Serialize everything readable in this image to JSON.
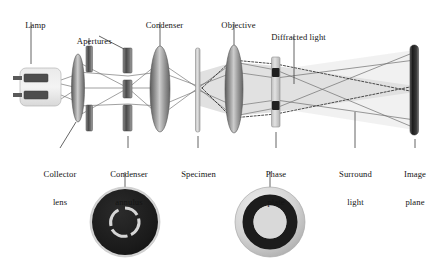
{
  "figure": {
    "colors": {
      "background": "#ffffff",
      "ink": "#141414",
      "lens_dark": "#5d5d5d",
      "lens_mid": "#8e8e8e",
      "lens_light": "#c8c8c8",
      "glass_light": "#d9d9d9",
      "ray_line": "#6b6b6b",
      "beam_fill": "#d7d7d7",
      "disc_dark": "#1f1f1f",
      "disc_light": "#cfcfcf"
    }
  },
  "labels_top": [
    {
      "key": "lamp",
      "text": "Lamp",
      "x": 8,
      "y": 12
    },
    {
      "key": "apertures",
      "text": "Apertures",
      "x": 64,
      "y": 29
    },
    {
      "key": "condenser",
      "text": "Condenser",
      "x": 133,
      "y": 12
    },
    {
      "key": "objective",
      "text": "Objective",
      "x": 210,
      "y": 12
    },
    {
      "key": "diffracted_light",
      "text": "Diffracted light",
      "x": 256,
      "y": 24
    }
  ],
  "labels_bottom": [
    {
      "key": "collector_lens",
      "line1": "Collector",
      "line2": "lens",
      "x": 33,
      "y": 152
    },
    {
      "key": "condenser_annulus",
      "line1": "Condenser",
      "line2": "annulus",
      "x": 107,
      "y": 152
    },
    {
      "key": "specimen",
      "line1": "Specimen",
      "line2": "",
      "x": 180,
      "y": 152
    },
    {
      "key": "phase_plate",
      "line1": "Phase",
      "line2": "plate",
      "x": 256,
      "y": 152
    },
    {
      "key": "surround_light",
      "line1": "Surround",
      "line2": "light",
      "x": 338,
      "y": 152
    },
    {
      "key": "image_plane",
      "line1": "Image",
      "line2": "plane",
      "x": 404,
      "y": 152
    }
  ],
  "components": [
    {
      "key": "lamp",
      "type": "lamp-housing",
      "x": 20,
      "y": 68,
      "width": 41,
      "height": 38
    },
    {
      "key": "collector-lens",
      "type": "lens",
      "cx": 78,
      "cy": 88,
      "rx": 6.5,
      "ry": 34
    },
    {
      "key": "aperture-upper",
      "type": "bar",
      "x": 86,
      "y": 46,
      "width": 6,
      "height": 26
    },
    {
      "key": "aperture-lower",
      "type": "bar",
      "x": 86,
      "y": 105,
      "width": 6,
      "height": 26
    },
    {
      "key": "condenser-annulus-top",
      "type": "bar",
      "x": 124,
      "y": 48,
      "width": 8,
      "height": 24
    },
    {
      "key": "condenser-annulus-mid",
      "type": "bar",
      "x": 124,
      "y": 80,
      "width": 8,
      "height": 18
    },
    {
      "key": "condenser-annulus-bottom",
      "type": "bar",
      "x": 124,
      "y": 105,
      "width": 8,
      "height": 26
    },
    {
      "key": "condenser-lens",
      "type": "lens",
      "cx": 160,
      "cy": 89,
      "rx": 10,
      "ry": 43
    },
    {
      "key": "specimen",
      "type": "slab",
      "x": 195,
      "y": 48,
      "width": 4.5,
      "height": 84
    },
    {
      "key": "objective-lens",
      "type": "lens",
      "cx": 234,
      "cy": 89,
      "rx": 9,
      "ry": 44
    },
    {
      "key": "phase-plate",
      "type": "slab-with-rings",
      "x": 272,
      "y": 57,
      "width": 8,
      "height": 70
    },
    {
      "key": "image-plane",
      "type": "screen",
      "x": 411,
      "y": 45,
      "width": 8,
      "height": 90
    }
  ],
  "insets": [
    {
      "key": "condenser-annulus-inset",
      "cx": 125,
      "cy": 222,
      "r": 35,
      "style": "dark-disc-with-light-ring",
      "ring_radius": 14,
      "ring_thickness": 3,
      "ring_gaps": 4
    },
    {
      "key": "phase-plate-inset",
      "cx": 270,
      "cy": 222,
      "r": 35,
      "style": "light-disc-with-dark-ring",
      "ring_radius": 22,
      "ring_thickness": 11
    }
  ],
  "ray_legend": {
    "diffracted": "dashed",
    "surround": "solid"
  }
}
